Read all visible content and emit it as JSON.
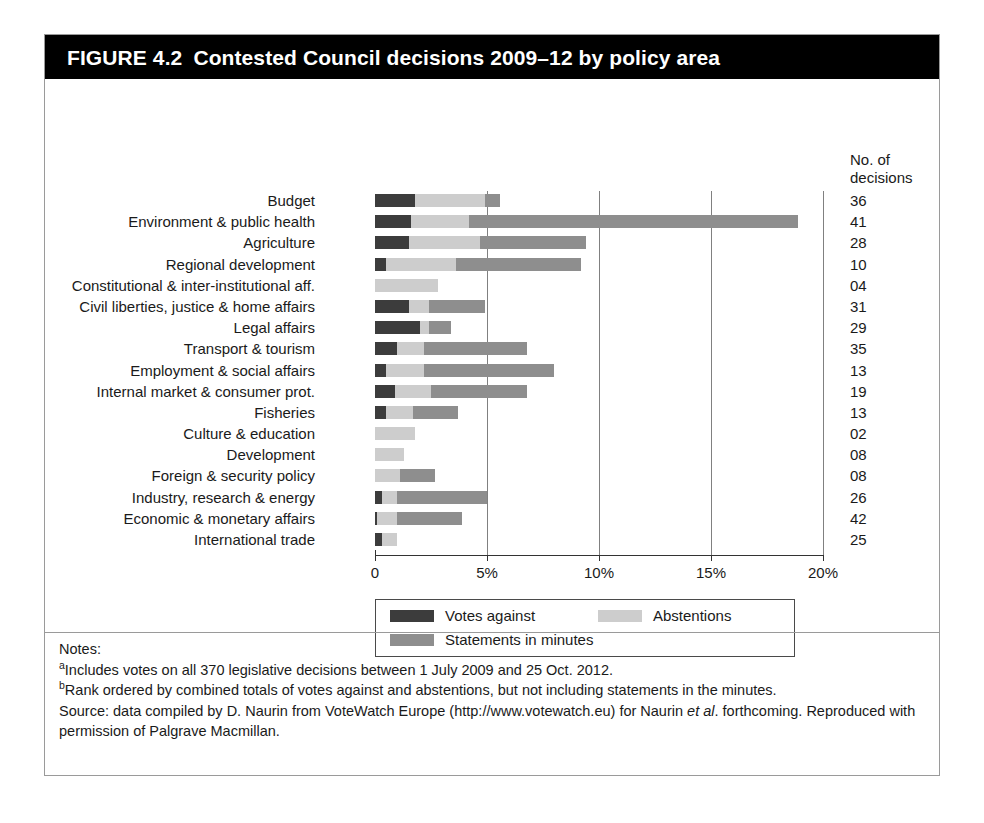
{
  "figure": {
    "number": "FIGURE 4.2",
    "title": "Contested Council decisions 2009–12 by policy area"
  },
  "decisions_header_line1": "No. of",
  "decisions_header_line2": "decisions",
  "colors": {
    "votes_against": "#3c3c3c",
    "abstentions": "#cdcdcd",
    "statements": "#8e8e8e",
    "title_bar": "#000000",
    "gridline": "#808080"
  },
  "legend": {
    "items": [
      {
        "label": "Votes against",
        "color": "#3c3c3c"
      },
      {
        "label": "Abstentions",
        "color": "#cdcdcd"
      },
      {
        "label": "Statements in minutes",
        "color": "#8e8e8e"
      }
    ]
  },
  "notes": {
    "heading": "Notes:",
    "note_a_marker": "a",
    "note_a": "Includes votes on all 370 legislative decisions between 1 July 2009 and 25 Oct. 2012.",
    "note_b_marker": "b",
    "note_b": "Rank ordered by combined totals of votes against and abstentions, but not including statements in the minutes.",
    "source_prefix": "Source: data compiled by D. Naurin from VoteWatch Europe (http://www.votewatch.eu) for Naurin ",
    "source_italic": "et al",
    "source_suffix": ". forthcoming. Reproduced with permission of Palgrave Macmillan."
  },
  "chart_data": {
    "type": "bar",
    "orientation": "horizontal",
    "stacked": true,
    "title": "Contested Council decisions 2009–12 by policy area",
    "xlabel": "",
    "ylabel": "",
    "xlim": [
      0,
      20
    ],
    "xtick_labels": [
      "0",
      "5%",
      "10%",
      "15%",
      "20%"
    ],
    "xtick_values": [
      0,
      5,
      10,
      15,
      20
    ],
    "grid": "vertical",
    "legend_position": "bottom",
    "extra_column_header": "No. of decisions",
    "categories": [
      "Budget",
      "Environment & public health",
      "Agriculture",
      "Regional development",
      "Constitutional & inter-institutional aff.",
      "Civil liberties, justice & home affairs",
      "Legal affairs",
      "Transport & tourism",
      "Employment & social affairs",
      "Internal market & consumer prot.",
      "Fisheries",
      "Culture & education",
      "Development",
      "Foreign & security policy",
      "Industry, research & energy",
      "Economic & monetary affairs",
      "International trade"
    ],
    "decisions": [
      "36",
      "41",
      "28",
      "10",
      "04",
      "31",
      "29",
      "35",
      "13",
      "19",
      "13",
      "02",
      "08",
      "08",
      "26",
      "42",
      "25"
    ],
    "series": [
      {
        "name": "Votes against",
        "color": "#3c3c3c",
        "values": [
          1.8,
          1.6,
          1.5,
          0.5,
          0.0,
          1.5,
          2.0,
          1.0,
          0.5,
          0.9,
          0.5,
          0.0,
          0.0,
          0.0,
          0.3,
          0.1,
          0.3
        ]
      },
      {
        "name": "Abstentions",
        "color": "#cdcdcd",
        "values": [
          3.1,
          2.6,
          3.2,
          3.1,
          2.8,
          0.9,
          0.4,
          1.2,
          1.7,
          1.6,
          1.2,
          1.8,
          1.3,
          1.1,
          0.7,
          0.9,
          0.7
        ]
      },
      {
        "name": "Statements in minutes",
        "color": "#8e8e8e",
        "values": [
          0.7,
          14.7,
          4.7,
          5.6,
          0.0,
          2.5,
          1.0,
          4.6,
          5.8,
          4.3,
          2.0,
          0.0,
          0.0,
          1.6,
          4.0,
          2.9,
          0.0
        ]
      }
    ],
    "totals": [
      5.6,
      18.9,
      9.4,
      9.2,
      2.8,
      4.9,
      3.4,
      6.8,
      8.0,
      6.8,
      3.7,
      1.8,
      1.3,
      2.7,
      5.0,
      3.9,
      1.0
    ]
  }
}
